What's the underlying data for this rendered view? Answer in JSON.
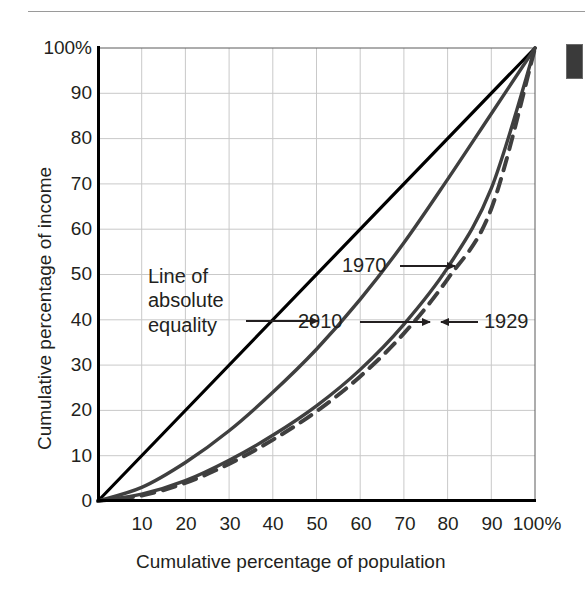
{
  "figure": {
    "type": "lorenz-curve-chart",
    "background": "#ffffff",
    "rule_color": "#9a9a9a",
    "tab_color": "#3a3a3a"
  },
  "chart_data": {
    "type": "line",
    "title": "",
    "subtitle": "",
    "xlabel": "Cumulative percentage of population",
    "ylabel": "Cumulative percentage of income",
    "xlim": [
      0,
      100
    ],
    "ylim": [
      0,
      100
    ],
    "grid": true,
    "grid_step": 10,
    "legend_position": "inline-annotations",
    "x_tick_labels": [
      "10",
      "20",
      "30",
      "40",
      "50",
      "60",
      "70",
      "80",
      "90",
      "100%"
    ],
    "x_tick_values": [
      10,
      20,
      30,
      40,
      50,
      60,
      70,
      80,
      90,
      100
    ],
    "y_tick_labels": [
      "0",
      "10",
      "20",
      "30",
      "40",
      "50",
      "60",
      "70",
      "80",
      "90",
      "100%"
    ],
    "y_tick_values": [
      0,
      10,
      20,
      30,
      40,
      50,
      60,
      70,
      80,
      90,
      100
    ],
    "series": [
      {
        "name": "Line of absolute equality",
        "style": "solid",
        "color": "#000000",
        "width": 3.2,
        "x": [
          0,
          100
        ],
        "values": [
          0,
          100
        ]
      },
      {
        "name": "1970",
        "style": "solid",
        "color": "#3f3f3f",
        "width": 3.4,
        "x": [
          0,
          10,
          20,
          30,
          40,
          50,
          60,
          70,
          80,
          90,
          100
        ],
        "values": [
          0,
          3.0,
          8.5,
          15.5,
          24.0,
          33.5,
          44.5,
          57.0,
          71.0,
          85.5,
          100
        ]
      },
      {
        "name": "2010",
        "style": "solid",
        "color": "#3f3f3f",
        "width": 3.4,
        "x": [
          0,
          10,
          20,
          30,
          40,
          50,
          60,
          70,
          80,
          90,
          100
        ],
        "values": [
          0,
          1.5,
          4.5,
          9.0,
          14.5,
          21.0,
          29.0,
          39.0,
          51.5,
          69.0,
          100
        ]
      },
      {
        "name": "1929",
        "style": "dashed",
        "color": "#3f3f3f",
        "width": 4.0,
        "x": [
          0,
          10,
          20,
          30,
          40,
          50,
          60,
          70,
          80,
          90,
          100
        ],
        "values": [
          0,
          1.2,
          4.0,
          8.2,
          13.5,
          19.8,
          27.5,
          37.0,
          49.0,
          64.5,
          100
        ]
      }
    ],
    "annotations": [
      {
        "label": "Line of absolute equality",
        "target_series": "Line of absolute equality",
        "arrow": "right"
      },
      {
        "label": "1970",
        "target_series": "1970",
        "arrow": "right"
      },
      {
        "label": "2010",
        "target_series": "2010",
        "arrow": "right"
      },
      {
        "label": "1929",
        "target_series": "1929",
        "arrow": "left"
      }
    ]
  },
  "annotations": {
    "equality_line_1": "Line of",
    "equality_line_2": "absolute",
    "equality_line_3": "equality",
    "label_1970": "1970",
    "label_2010": "2010",
    "label_1929": "1929"
  },
  "axes": {
    "y_title": "Cumulative percentage of income",
    "x_title": "Cumulative percentage of population",
    "y_ticks": [
      "100%",
      "90",
      "80",
      "70",
      "60",
      "50",
      "40",
      "30",
      "20",
      "10",
      "0"
    ],
    "x_ticks": [
      "10",
      "20",
      "30",
      "40",
      "50",
      "60",
      "70",
      "80",
      "90",
      "100%"
    ]
  }
}
